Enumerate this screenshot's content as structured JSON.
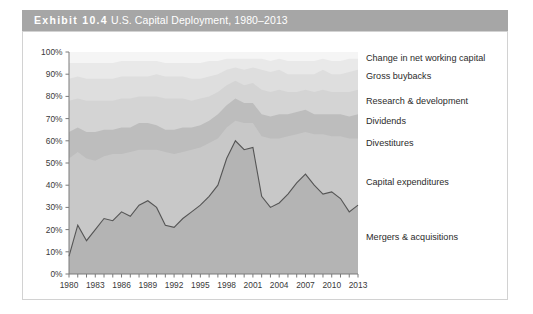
{
  "exhibit": {
    "label": "Exhibit 10.4",
    "title": "U.S. Capital Deployment, 1980–2013",
    "full_title": "Exhibit 10.4 U.S. Capital Deployment, 1980–2013"
  },
  "colors": {
    "title_bar": "#a6a6a6",
    "title_text": "#ffffff",
    "panel_border": "#d2d2d2",
    "axis": "#7a7a7a",
    "ma_line": "#555555",
    "band_mergers": "#b4b4b4",
    "band_capex": "#c8c8c8",
    "band_divestitures": "#bdbdbd",
    "band_dividends": "#d4d4d4",
    "band_rnd": "#dedede",
    "band_buybacks": "#e9e9e9",
    "band_nwc": "#f5f5f5"
  },
  "chart_data": {
    "type": "area",
    "title": "U.S. Capital Deployment, 1980–2013",
    "xlabel": "",
    "ylabel": "",
    "ylim": [
      0,
      100
    ],
    "yunit": "%",
    "grid": false,
    "stacked": true,
    "normalized_to_100": true,
    "legend_position": "right-inline",
    "ytick_labels": [
      "0%",
      "10%",
      "20%",
      "30%",
      "40%",
      "50%",
      "60%",
      "70%",
      "80%",
      "90%",
      "100%"
    ],
    "ytick_values": [
      0,
      10,
      20,
      30,
      40,
      50,
      60,
      70,
      80,
      90,
      100
    ],
    "xtick_labels": [
      "1980",
      "1983",
      "1986",
      "1989",
      "1992",
      "1995",
      "1998",
      "2001",
      "2004",
      "2007",
      "2010",
      "2013"
    ],
    "xtick_values": [
      1980,
      1983,
      1986,
      1989,
      1992,
      1995,
      1998,
      2001,
      2004,
      2007,
      2010,
      2013
    ],
    "x": [
      1980,
      1981,
      1982,
      1983,
      1984,
      1985,
      1986,
      1987,
      1988,
      1989,
      1990,
      1991,
      1992,
      1993,
      1994,
      1995,
      1996,
      1997,
      1998,
      1999,
      2000,
      2001,
      2002,
      2003,
      2004,
      2005,
      2006,
      2007,
      2008,
      2009,
      2010,
      2011,
      2012,
      2013
    ],
    "series": [
      {
        "name": "Mergers & acquisitions",
        "color": "#b4b4b4",
        "values": [
          8,
          22,
          15,
          20,
          25,
          24,
          28,
          26,
          31,
          33,
          30,
          22,
          21,
          25,
          28,
          31,
          35,
          40,
          52,
          60,
          56,
          57,
          35,
          30,
          32,
          36,
          41,
          45,
          40,
          36,
          37,
          34,
          28,
          31
        ]
      },
      {
        "name": "Capital expenditures",
        "color": "#c8c8c8",
        "values": [
          44,
          33,
          37,
          31,
          28,
          30,
          26,
          29,
          25,
          23,
          26,
          33,
          33,
          30,
          28,
          26,
          24,
          21,
          14,
          9,
          12,
          11,
          27,
          31,
          29,
          26,
          22,
          19,
          23,
          27,
          25,
          28,
          33,
          30
        ]
      },
      {
        "name": "Divestitures",
        "color": "#bdbdbd",
        "values": [
          12,
          11,
          12,
          13,
          12,
          11,
          12,
          11,
          12,
          12,
          11,
          10,
          11,
          11,
          10,
          10,
          10,
          11,
          10,
          10,
          9,
          9,
          10,
          10,
          11,
          10,
          10,
          10,
          9,
          9,
          10,
          10,
          10,
          11
        ]
      },
      {
        "name": "Dividends",
        "color": "#d4d4d4",
        "values": [
          14,
          13,
          14,
          14,
          13,
          13,
          13,
          13,
          12,
          12,
          13,
          14,
          14,
          13,
          12,
          12,
          11,
          10,
          9,
          8,
          8,
          9,
          11,
          11,
          11,
          10,
          9,
          9,
          10,
          11,
          10,
          10,
          11,
          11
        ]
      },
      {
        "name": "Research & development",
        "color": "#dedede",
        "values": [
          10,
          10,
          10,
          10,
          10,
          10,
          10,
          10,
          9,
          9,
          10,
          10,
          10,
          10,
          10,
          9,
          9,
          8,
          7,
          6,
          7,
          7,
          9,
          9,
          9,
          8,
          8,
          7,
          8,
          9,
          8,
          8,
          9,
          9
        ]
      },
      {
        "name": "Gross buybacks",
        "color": "#e9e9e9",
        "values": [
          7,
          6,
          7,
          7,
          7,
          7,
          7,
          7,
          7,
          7,
          6,
          6,
          6,
          6,
          7,
          7,
          7,
          6,
          5,
          4,
          5,
          4,
          5,
          5,
          5,
          6,
          6,
          6,
          6,
          5,
          6,
          6,
          6,
          5
        ]
      },
      {
        "name": "Change in net working capital",
        "color": "#f5f5f5",
        "values": [
          5,
          5,
          5,
          5,
          5,
          5,
          4,
          4,
          4,
          4,
          4,
          5,
          5,
          5,
          5,
          5,
          4,
          4,
          3,
          3,
          3,
          3,
          3,
          4,
          3,
          4,
          4,
          4,
          4,
          3,
          4,
          4,
          3,
          3
        ]
      }
    ],
    "legend": [
      {
        "label": "Change in net working capital"
      },
      {
        "label": "Gross buybacks"
      },
      {
        "label": "Research & development"
      },
      {
        "label": "Dividends"
      },
      {
        "label": "Divestitures"
      },
      {
        "label": "Capital expenditures"
      },
      {
        "label": "Mergers & acquisitions"
      }
    ]
  }
}
